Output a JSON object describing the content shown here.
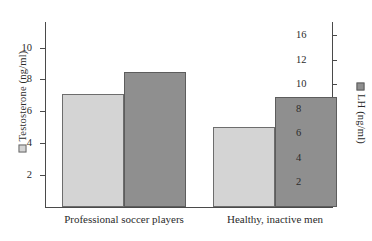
{
  "chart_data": {
    "type": "bar",
    "title": "",
    "categories": [
      "Professional soccer players",
      "Healthy, inactive men"
    ],
    "series": [
      {
        "name": "Testosterone (ng/ml)",
        "axis": "left",
        "color": "#d4d4d4",
        "values": [
          7.1,
          5.0
        ]
      },
      {
        "name": "LH (ng/ml)",
        "axis": "right",
        "color": "#8f8f8f",
        "values": [
          11.0,
          9.0
        ]
      }
    ],
    "left_axis": {
      "label": "Testosterone (ng/ml)",
      "ticks": [
        2,
        4,
        6,
        8,
        10
      ],
      "tick_labels": [
        "2",
        "4",
        "6",
        "8",
        "10"
      ],
      "min": 0,
      "max": 11.6
    },
    "right_axis": {
      "label": "LH (ng/ml)",
      "ticks": [
        2,
        4,
        6,
        8,
        10,
        12,
        16
      ],
      "tick_labels": [
        "2",
        "4",
        "6",
        "8",
        "10",
        "12",
        "16"
      ],
      "min": 0,
      "max": 18.55
    },
    "xlabel": "",
    "grid": false,
    "legend_position": "axis-titles"
  },
  "legend": {
    "testosterone_swatch": "light-gray-square-icon",
    "lh_swatch": "dark-gray-square-icon"
  }
}
